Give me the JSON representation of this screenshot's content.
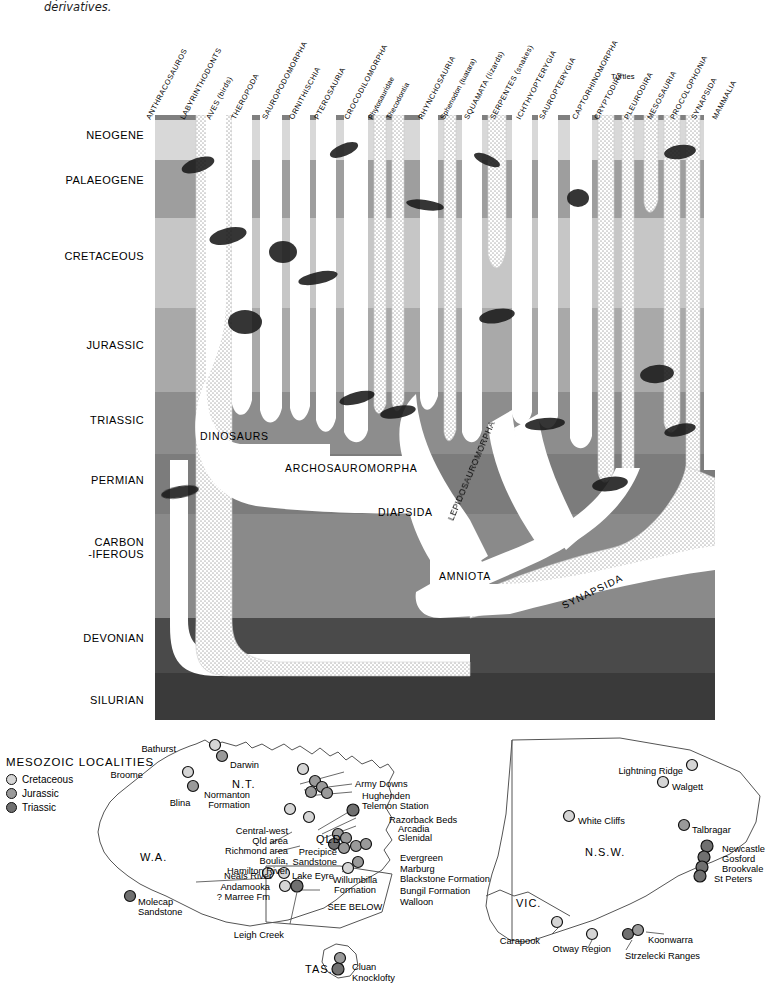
{
  "caption": "reptiles and their derivatives.",
  "chart": {
    "periods": [
      {
        "label": "NEOGENE",
        "y": 135
      },
      {
        "label": "PALAEOGENE",
        "y": 180
      },
      {
        "label": "CRETACEOUS",
        "y": 256
      },
      {
        "label": "JURASSIC",
        "y": 345
      },
      {
        "label": "TRIASSIC",
        "y": 420
      },
      {
        "label": "PERMIAN",
        "y": 480
      },
      {
        "label": "CARBON\n-IFEROUS",
        "y": 543
      },
      {
        "label": "DEVONIAN",
        "y": 638
      },
      {
        "label": "SILURIAN",
        "y": 700
      }
    ],
    "band_colors": [
      "#d8d8d8",
      "#a0a0a0",
      "#c6c6c6",
      "#a8a8a8",
      "#8e8e8e",
      "#7e7e7e",
      "#8a8a8a",
      "#4a4a4a",
      "#3c3c3c"
    ],
    "taxa": [
      {
        "label": "ANTHRACOSAUROS",
        "x": 152,
        "y": 112
      },
      {
        "label": "LABYRINTHODONTS",
        "x": 186,
        "y": 112
      },
      {
        "label": "AVES (birds)",
        "x": 212,
        "y": 112
      },
      {
        "label": "THEROPODA",
        "x": 237,
        "y": 112
      },
      {
        "label": "SAUROPODOMORPHA",
        "x": 268,
        "y": 112
      },
      {
        "label": "ORNITHISCHIA",
        "x": 295,
        "y": 112
      },
      {
        "label": "PTEROSAURIA",
        "x": 320,
        "y": 112
      },
      {
        "label": "CROCODILOMORPHA",
        "x": 350,
        "y": 112
      },
      {
        "label": "Phytosauridae",
        "x": 374,
        "y": 112
      },
      {
        "label": "Thecodontia",
        "x": 392,
        "y": 112
      },
      {
        "label": "RHYNCHOSAURIA",
        "x": 424,
        "y": 112
      },
      {
        "label": "Sphenodon (tuatara)",
        "x": 446,
        "y": 112
      },
      {
        "label": "SQUAMATA (lizards)",
        "x": 470,
        "y": 112
      },
      {
        "label": "SERPENTES (snakes)",
        "x": 496,
        "y": 112
      },
      {
        "label": "ICHTHYOPTERYGIA",
        "x": 522,
        "y": 112
      },
      {
        "label": "SAUROPTERYGIA",
        "x": 545,
        "y": 112
      },
      {
        "label": "CAPTORHINOMORPHA",
        "x": 578,
        "y": 112
      },
      {
        "label": "CRYPTODIRA",
        "x": 600,
        "y": 112
      },
      {
        "label": "PLEURODIRA",
        "x": 630,
        "y": 112
      },
      {
        "label": "MESOSAURIA",
        "x": 653,
        "y": 112
      },
      {
        "label": "PROCOLOPHONIA",
        "x": 676,
        "y": 112
      },
      {
        "label": "SYNAPSIDA",
        "x": 697,
        "y": 112
      },
      {
        "label": "MAMMALIA",
        "x": 718,
        "y": 112
      }
    ],
    "taxon_group_label": {
      "label": "Turtles",
      "x": 611,
      "y": 72
    },
    "clades": [
      {
        "label": "DINOSAURS",
        "x": 200,
        "y": 430
      },
      {
        "label": "ARCHOSAUROMORPHA",
        "x": 285,
        "y": 462
      },
      {
        "label": "DIAPSIDA",
        "x": 378,
        "y": 506
      },
      {
        "label": "AMNIOTA",
        "x": 439,
        "y": 570
      },
      {
        "label": "LEPIDOSAUROMORPHA",
        "x": 455,
        "y": 512
      },
      {
        "label": "SYNAPSIDA",
        "x": 565,
        "y": 595
      }
    ]
  },
  "maps": {
    "legend": {
      "title": "MESOZOIC LOCALITIES",
      "items": [
        {
          "label": "Cretaceous",
          "color": "#d5d5d5"
        },
        {
          "label": "Jurassic",
          "color": "#9a9a9a"
        },
        {
          "label": "Triassic",
          "color": "#707070"
        }
      ]
    },
    "regions": [
      {
        "label": "N.T.",
        "x": 232,
        "y": 778
      },
      {
        "label": "W.A.",
        "x": 140,
        "y": 851
      },
      {
        "label": "QLD.",
        "x": 316,
        "y": 833
      },
      {
        "label": "TAS.",
        "x": 305,
        "y": 963
      },
      {
        "label": "N.S.W.",
        "x": 585,
        "y": 846
      },
      {
        "label": "VIC.",
        "x": 516,
        "y": 897
      }
    ],
    "places": [
      {
        "label": "Bathurst",
        "x": 176,
        "y": 744,
        "align": "r"
      },
      {
        "label": "Darwin",
        "x": 230,
        "y": 760,
        "align": "l"
      },
      {
        "label": "Broome",
        "x": 143,
        "y": 770,
        "align": "r"
      },
      {
        "label": "Blina",
        "x": 180,
        "y": 798,
        "align": "c"
      },
      {
        "label": "Normanton\nFormation",
        "x": 250,
        "y": 790,
        "align": "r"
      },
      {
        "label": "Army Downs",
        "x": 355,
        "y": 779,
        "align": "l"
      },
      {
        "label": "Hughenden",
        "x": 362,
        "y": 791,
        "align": "l"
      },
      {
        "label": "Telemon Station",
        "x": 362,
        "y": 801,
        "align": "l"
      },
      {
        "label": "Razorback Beds",
        "x": 389,
        "y": 815,
        "align": "l"
      },
      {
        "label": "Arcadia",
        "x": 398,
        "y": 824,
        "align": "l"
      },
      {
        "label": "Glenidal",
        "x": 398,
        "y": 833,
        "align": "l"
      },
      {
        "label": "Central-west\nQld area",
        "x": 288,
        "y": 826,
        "align": "r"
      },
      {
        "label": "Richmond area",
        "x": 288,
        "y": 841,
        "align": "r"
      },
      {
        "label": "Boulia,\nHamilton River",
        "x": 288,
        "y": 850,
        "align": "r"
      },
      {
        "label": "Precipice\nSandstone",
        "x": 337,
        "y": 845,
        "align": "r"
      },
      {
        "label": "Neals River",
        "x": 272,
        "y": 871,
        "align": "r"
      },
      {
        "label": "Lake Eyre",
        "x": 296,
        "y": 871,
        "align": "l"
      },
      {
        "label": "Evergreen",
        "x": 400,
        "y": 853,
        "align": "l"
      },
      {
        "label": "Marburg",
        "x": 400,
        "y": 864,
        "align": "l"
      },
      {
        "label": "Blackstone Formation",
        "x": 400,
        "y": 874,
        "align": "l"
      },
      {
        "label": "Bungil Formation",
        "x": 400,
        "y": 886,
        "align": "l"
      },
      {
        "label": "Walloon",
        "x": 400,
        "y": 897,
        "align": "l"
      },
      {
        "label": "Willumbilla\nFormation",
        "x": 355,
        "y": 875,
        "align": "c"
      },
      {
        "label": "SEE BELOW",
        "x": 353,
        "y": 902,
        "align": "c"
      },
      {
        "label": "Andamooka\n? Marree Fm",
        "x": 270,
        "y": 882,
        "align": "r"
      },
      {
        "label": "Leigh Creek",
        "x": 284,
        "y": 930,
        "align": "r"
      },
      {
        "label": "Molecap\nSandstone",
        "x": 138,
        "y": 897,
        "align": "l"
      },
      {
        "label": "Cluan",
        "x": 352,
        "y": 962,
        "align": "l"
      },
      {
        "label": "Knocklofty",
        "x": 352,
        "y": 973,
        "align": "l"
      },
      {
        "label": "Lightning Ridge",
        "x": 683,
        "y": 766,
        "align": "r"
      },
      {
        "label": "Walgett",
        "x": 672,
        "y": 782,
        "align": "l"
      },
      {
        "label": "White Cliffs",
        "x": 578,
        "y": 816,
        "align": "l"
      },
      {
        "label": "Talbragar",
        "x": 692,
        "y": 825,
        "align": "l"
      },
      {
        "label": "Newcastle",
        "x": 722,
        "y": 844,
        "align": "l"
      },
      {
        "label": "Gosford",
        "x": 722,
        "y": 854,
        "align": "l"
      },
      {
        "label": "Brookvale",
        "x": 722,
        "y": 864,
        "align": "l"
      },
      {
        "label": "St Peters",
        "x": 714,
        "y": 874,
        "align": "l"
      },
      {
        "label": "Carapook",
        "x": 540,
        "y": 936,
        "align": "r"
      },
      {
        "label": "Otway Region",
        "x": 611,
        "y": 944,
        "align": "r"
      },
      {
        "label": "Strzelecki Ranges",
        "x": 700,
        "y": 951,
        "align": "r"
      },
      {
        "label": "Koonwarra",
        "x": 648,
        "y": 935,
        "align": "l"
      }
    ]
  }
}
